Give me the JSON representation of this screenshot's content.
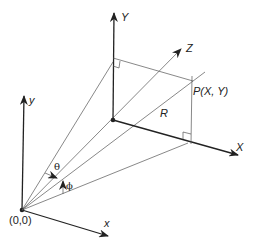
{
  "diagram": {
    "labels": {
      "world_y": "y",
      "world_x": "x",
      "origin": "(0,0)",
      "image_Y": "Y",
      "image_X": "X",
      "image_Z": "Z",
      "point": "P(X, Y)",
      "radius": "R",
      "theta": "θ",
      "phi": "ϕ"
    },
    "colors": {
      "line": "#222222",
      "thin_line": "#555555",
      "background": "#ffffff"
    }
  }
}
